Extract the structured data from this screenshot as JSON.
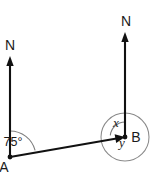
{
  "diagram": {
    "background_color": "#ffffff",
    "line_color": "#111111",
    "arc_color": "#7d7d7d",
    "circle_color": "#8a8a8a",
    "text_color": "#1a1a1a"
  },
  "labels": {
    "north_left": "N",
    "north_right": "N",
    "point_a": "A",
    "point_b": "B",
    "angle_at_a": "75°",
    "angle_x": "x",
    "angle_y": "y"
  },
  "icons": {
    "north_arrow_left": "north-arrow-icon",
    "north_arrow_right": "north-arrow-icon",
    "bearing_arrow_ab": "arrow-head-icon"
  },
  "geometry": {
    "point_a": {
      "x": 10,
      "y": 157
    },
    "point_b": {
      "x": 125,
      "y": 137
    },
    "north_left_top": {
      "x": 10,
      "y": 58
    },
    "north_right_top": {
      "x": 125,
      "y": 34
    },
    "circle_center": {
      "x": 125,
      "y": 137
    },
    "circle_radius": 24,
    "arc_a_radius": 26,
    "arc_x_radius": 15,
    "angle_a_degrees": 75
  }
}
